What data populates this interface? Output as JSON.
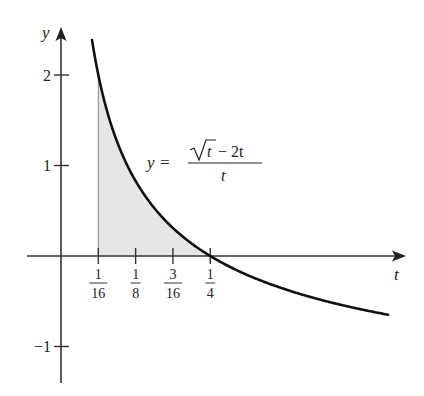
{
  "chart_data": {
    "type": "line",
    "title": "",
    "xlabel": "t",
    "ylabel": "y",
    "equation_label": {
      "lhs": "y =",
      "numerator_sqrt": "t",
      "numerator_rest": "− 2t",
      "denominator": "t"
    },
    "function": "y = (sqrt(t) - 2t)/t",
    "x_ticks": [
      {
        "value": 0.0625,
        "num": "1",
        "den": "16"
      },
      {
        "value": 0.125,
        "num": "1",
        "den": "8"
      },
      {
        "value": 0.1875,
        "num": "3",
        "den": "16"
      },
      {
        "value": 0.25,
        "num": "1",
        "den": "4"
      }
    ],
    "y_ticks": [
      {
        "value": 2,
        "label": "2"
      },
      {
        "value": 1,
        "label": "1"
      },
      {
        "value": -1,
        "label": "−1"
      }
    ],
    "x": [
      0.052,
      0.0625,
      0.08,
      0.1,
      0.125,
      0.15,
      0.1875,
      0.22,
      0.25,
      0.3,
      0.35,
      0.4,
      0.45,
      0.5,
      0.548
    ],
    "values": [
      2.385,
      2.0,
      1.536,
      1.162,
      0.828,
      0.582,
      0.309,
      0.132,
      0.0,
      -0.174,
      -0.31,
      -0.419,
      -0.509,
      -0.586,
      -0.649
    ],
    "shaded_region": {
      "from": 0.0625,
      "to": 0.25,
      "fill": "#e6e6e6"
    },
    "xlim": [
      -0.056,
      0.577
    ],
    "ylim": [
      -1.41,
      2.53
    ],
    "grid": false,
    "colors": {
      "curve": "#111111",
      "axis": "#333333",
      "shade": "#e6e6e6"
    }
  }
}
